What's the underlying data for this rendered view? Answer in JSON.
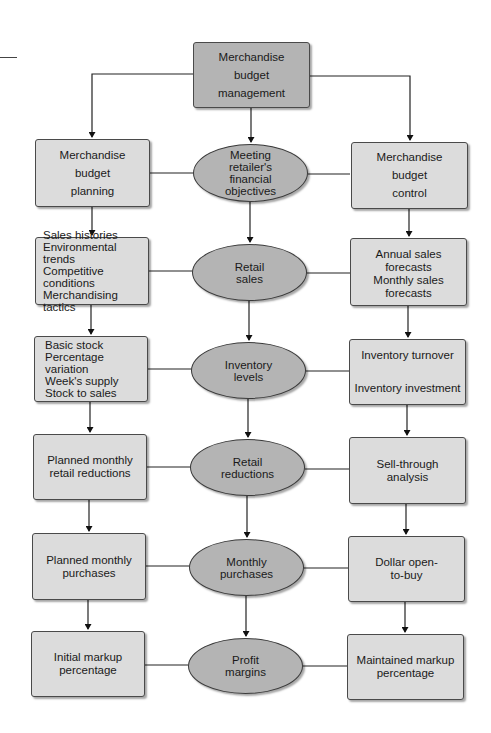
{
  "diagram": {
    "top": {
      "lines": [
        "Merchandise",
        "budget",
        "management"
      ]
    },
    "left_column": [
      {
        "lines": [
          "Merchandise",
          "budget",
          "planning"
        ]
      },
      {
        "lines": [
          "Sales histories",
          "Environmental trends",
          "Competitive conditions",
          "Merchandising tactics"
        ]
      },
      {
        "lines": [
          "Basic stock",
          "Percentage variation",
          "Week's supply",
          "Stock to sales"
        ]
      },
      {
        "lines": [
          "Planned monthly",
          "retail reductions"
        ]
      },
      {
        "lines": [
          "Planned monthly",
          "purchases"
        ]
      },
      {
        "lines": [
          "Initial markup",
          "percentage"
        ]
      }
    ],
    "center_column": [
      {
        "lines": [
          "Meeting",
          "retailer's",
          "financial",
          "objectives"
        ]
      },
      {
        "lines": [
          "Retail",
          "sales"
        ]
      },
      {
        "lines": [
          "Inventory",
          "levels"
        ]
      },
      {
        "lines": [
          "Retail",
          "reductions"
        ]
      },
      {
        "lines": [
          "Monthly",
          "purchases"
        ]
      },
      {
        "lines": [
          "Profit",
          "margins"
        ]
      }
    ],
    "right_column": [
      {
        "lines": [
          "Merchandise",
          "budget",
          "control"
        ]
      },
      {
        "lines": [
          "Annual sales forecasts",
          "Monthly sales forecasts"
        ]
      },
      {
        "lines": [
          "Inventory turnover",
          "Inventory investment"
        ]
      },
      {
        "lines": [
          "Sell-through",
          "analysis"
        ]
      },
      {
        "lines": [
          "Dollar open-",
          "to-buy"
        ]
      },
      {
        "lines": [
          "Maintained markup",
          "percentage"
        ]
      }
    ],
    "colors": {
      "box_fill": "#dcdcdc",
      "top_box_fill": "#b4b4b4",
      "ellipse_fill": "#b4b4b4",
      "stroke": "#3a3a3a"
    }
  }
}
